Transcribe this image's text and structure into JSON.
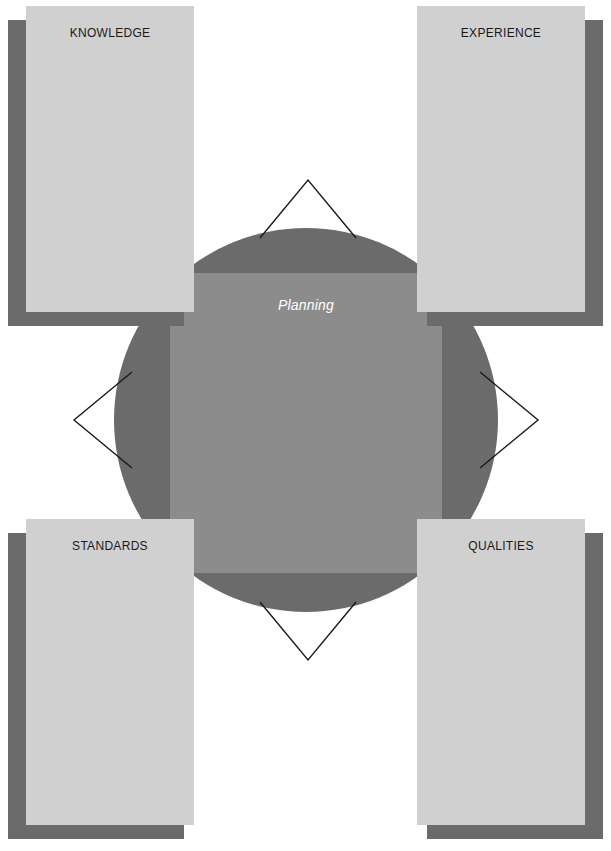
{
  "diagram": {
    "center": {
      "label": "Planning",
      "shape_circle": "circle",
      "shape_square": "square"
    },
    "cards": [
      {
        "id": "knowledge",
        "title": "KNOWLEDGE",
        "position": "top-left"
      },
      {
        "id": "experience",
        "title": "EXPERIENCE",
        "position": "top-right"
      },
      {
        "id": "standards",
        "title": "STANDARDS",
        "position": "bottom-left"
      },
      {
        "id": "qualities",
        "title": "QUALITIES",
        "position": "bottom-right"
      }
    ],
    "connectors": [
      {
        "id": "top",
        "direction": "up"
      },
      {
        "id": "right",
        "direction": "right"
      },
      {
        "id": "bottom",
        "direction": "down"
      },
      {
        "id": "left",
        "direction": "left"
      }
    ],
    "colors": {
      "background": "#ffffff",
      "circle": "#6b6b6b",
      "square": "#8c8c8c",
      "card_face": "#d0d0d0",
      "card_shadow": "#6b6b6b",
      "center_label": "#ffffff",
      "card_title": "#1a1a1a",
      "connector_stroke": "#1a1a1a"
    }
  }
}
